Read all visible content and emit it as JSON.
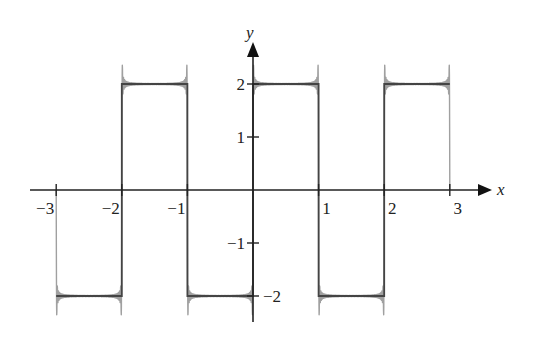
{
  "chart_data": {
    "type": "line",
    "title": "",
    "xlabel": "x",
    "ylabel": "y",
    "xlim": [
      -3,
      3
    ],
    "ylim": [
      -2,
      2
    ],
    "grid": false,
    "legend": null,
    "x_ticks": [
      "−3",
      "−2",
      "−1",
      "1",
      "2",
      "3"
    ],
    "y_ticks": [
      "2",
      "1",
      "−1",
      "−2"
    ],
    "series": [
      {
        "name": "square wave",
        "color": "#444444",
        "x": [
          -3,
          -2,
          -2,
          -1,
          -1,
          0,
          0,
          1,
          1,
          2,
          2,
          3
        ],
        "y": [
          -2,
          -2,
          2,
          2,
          -2,
          -2,
          2,
          2,
          -2,
          -2,
          2,
          2
        ]
      },
      {
        "name": "Fourier partial sum (Gibbs overshoot)",
        "color": "#a0a0a0",
        "description": "Oscillating approximation overshooting by ~0.35 near each discontinuity"
      }
    ],
    "annotations": []
  },
  "axes": {
    "x_label": "x",
    "y_label": "y",
    "x_tick_labels": [
      "−3",
      "−2",
      "−1",
      "1",
      "2",
      "3"
    ],
    "y_tick_labels": [
      "2",
      "1",
      "−1",
      "−2"
    ]
  }
}
